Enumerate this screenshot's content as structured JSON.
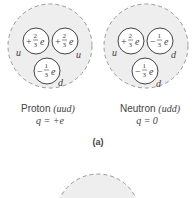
{
  "figure": {
    "label": "(a)",
    "colors": {
      "hadron_fill": "#eeeeee",
      "hadron_stroke": "#999999",
      "quark_fill": "#ffffff",
      "quark_stroke": "#444444",
      "text": "#444444"
    },
    "particles": [
      {
        "name": "Proton",
        "composition": "(uud)",
        "charge": "q = +e",
        "quarks": [
          {
            "flavor": "u",
            "sign": "+",
            "num": "2",
            "den": "3",
            "unit": "e"
          },
          {
            "flavor": "u",
            "sign": "+",
            "num": "2",
            "den": "3",
            "unit": "e"
          },
          {
            "flavor": "d",
            "sign": "−",
            "num": "1",
            "den": "3",
            "unit": "e"
          }
        ]
      },
      {
        "name": "Neutron",
        "composition": "(udd)",
        "charge": "q = 0",
        "quarks": [
          {
            "flavor": "u",
            "sign": "+",
            "num": "2",
            "den": "3",
            "unit": "e"
          },
          {
            "flavor": "d",
            "sign": "−",
            "num": "1",
            "den": "3",
            "unit": "e"
          },
          {
            "flavor": "d",
            "sign": "−",
            "num": "1",
            "den": "3",
            "unit": "e"
          }
        ]
      }
    ]
  }
}
